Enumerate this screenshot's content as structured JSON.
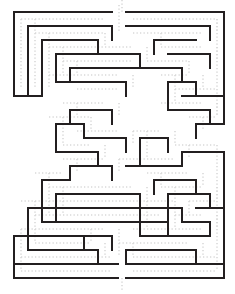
{
  "figure": {
    "kind": "maze-puzzle",
    "width": 235,
    "height": 294,
    "background_color": "#ffffff",
    "wall_color": "#231f20",
    "path_marker_color": "#d9d9d9",
    "wall_thickness": 2.0,
    "path_marker_thickness": 1.6,
    "path_marker_dash": "1.3 2.2"
  },
  "grid": {
    "origin_x": 14,
    "origin_y": 12,
    "cell": 14,
    "cols": 15,
    "rows": 19,
    "right_edge": 224,
    "bottom_edge": 278
  },
  "openings": {
    "entrance_label": "entrance",
    "entrance_side": "top",
    "entrance_col": 7,
    "entrance_x1": 118,
    "entrance_x2": 126,
    "exit_label": "exit",
    "exit_side": "bottom",
    "exit_col": 8,
    "exit_x1": 118,
    "exit_x2": 126
  },
  "walls": {
    "horizontal": [
      [
        14,
        112,
        12
      ],
      [
        126,
        224,
        12
      ],
      [
        28,
        112,
        26
      ],
      [
        126,
        210,
        26
      ],
      [
        154,
        196,
        40
      ],
      [
        42,
        98,
        40
      ],
      [
        56,
        140,
        54
      ],
      [
        168,
        210,
        54
      ],
      [
        70,
        140,
        68
      ],
      [
        140,
        182,
        68
      ],
      [
        56,
        126,
        82
      ],
      [
        168,
        196,
        82
      ],
      [
        182,
        224,
        96
      ],
      [
        14,
        28,
        96
      ],
      [
        28,
        42,
        96
      ],
      [
        70,
        112,
        110
      ],
      [
        168,
        210,
        110
      ],
      [
        56,
        84,
        124
      ],
      [
        196,
        224,
        124
      ],
      [
        84,
        126,
        138
      ],
      [
        140,
        168,
        138
      ],
      [
        56,
        98,
        152
      ],
      [
        182,
        224,
        152
      ],
      [
        70,
        112,
        166
      ],
      [
        126,
        182,
        166
      ],
      [
        42,
        70,
        180
      ],
      [
        154,
        196,
        180
      ],
      [
        56,
        140,
        194
      ],
      [
        168,
        210,
        194
      ],
      [
        28,
        182,
        208
      ],
      [
        196,
        224,
        208
      ],
      [
        42,
        168,
        222
      ],
      [
        182,
        210,
        222
      ],
      [
        14,
        112,
        236
      ],
      [
        140,
        210,
        236
      ],
      [
        28,
        98,
        250
      ],
      [
        126,
        196,
        250
      ],
      [
        14,
        118,
        264
      ],
      [
        126,
        224,
        264
      ],
      [
        14,
        118,
        278
      ],
      [
        126,
        224,
        278
      ]
    ],
    "vertical": [
      [
        14,
        12,
        96
      ],
      [
        14,
        236,
        278
      ],
      [
        224,
        12,
        124
      ],
      [
        224,
        152,
        278
      ],
      [
        28,
        26,
        96
      ],
      [
        28,
        208,
        250
      ],
      [
        42,
        40,
        96
      ],
      [
        42,
        180,
        222
      ],
      [
        56,
        54,
        82
      ],
      [
        56,
        124,
        152
      ],
      [
        56,
        194,
        222
      ],
      [
        70,
        68,
        82
      ],
      [
        70,
        110,
        124
      ],
      [
        70,
        166,
        180
      ],
      [
        84,
        124,
        138
      ],
      [
        84,
        236,
        250
      ],
      [
        98,
        40,
        54
      ],
      [
        98,
        152,
        166
      ],
      [
        98,
        250,
        264
      ],
      [
        112,
        26,
        40
      ],
      [
        112,
        110,
        124
      ],
      [
        112,
        166,
        180
      ],
      [
        112,
        236,
        250
      ],
      [
        126,
        82,
        96
      ],
      [
        126,
        138,
        152
      ],
      [
        126,
        250,
        264
      ],
      [
        140,
        54,
        68
      ],
      [
        140,
        138,
        166
      ],
      [
        140,
        194,
        236
      ],
      [
        154,
        40,
        54
      ],
      [
        154,
        180,
        194
      ],
      [
        168,
        82,
        110
      ],
      [
        168,
        138,
        152
      ],
      [
        168,
        194,
        236
      ],
      [
        182,
        68,
        82
      ],
      [
        182,
        152,
        166
      ],
      [
        182,
        208,
        222
      ],
      [
        196,
        82,
        96
      ],
      [
        196,
        124,
        138
      ],
      [
        196,
        180,
        194
      ],
      [
        196,
        250,
        264
      ],
      [
        210,
        26,
        40
      ],
      [
        210,
        54,
        68
      ],
      [
        210,
        110,
        124
      ],
      [
        210,
        194,
        208
      ],
      [
        210,
        222,
        236
      ]
    ]
  },
  "path_markers": {
    "horizontal": [
      [
        21,
        105,
        19
      ],
      [
        133,
        217,
        19
      ],
      [
        35,
        105,
        33
      ],
      [
        133,
        203,
        33
      ],
      [
        49,
        133,
        47
      ],
      [
        161,
        203,
        47
      ],
      [
        63,
        133,
        61
      ],
      [
        147,
        189,
        61
      ],
      [
        49,
        119,
        75
      ],
      [
        161,
        189,
        75
      ],
      [
        77,
        119,
        89
      ],
      [
        175,
        217,
        89
      ],
      [
        63,
        105,
        103
      ],
      [
        161,
        203,
        103
      ],
      [
        49,
        91,
        117
      ],
      [
        189,
        217,
        117
      ],
      [
        77,
        119,
        131
      ],
      [
        133,
        161,
        131
      ],
      [
        63,
        91,
        145
      ],
      [
        175,
        217,
        145
      ],
      [
        63,
        105,
        159
      ],
      [
        119,
        175,
        159
      ],
      [
        35,
        63,
        173
      ],
      [
        147,
        189,
        173
      ],
      [
        49,
        133,
        187
      ],
      [
        161,
        203,
        187
      ],
      [
        21,
        175,
        201
      ],
      [
        189,
        217,
        201
      ],
      [
        35,
        161,
        215
      ],
      [
        175,
        203,
        215
      ],
      [
        21,
        105,
        229
      ],
      [
        133,
        203,
        229
      ],
      [
        35,
        91,
        243
      ],
      [
        119,
        189,
        243
      ],
      [
        21,
        111,
        257
      ],
      [
        133,
        217,
        257
      ],
      [
        21,
        111,
        271
      ],
      [
        133,
        217,
        271
      ]
    ],
    "vertical": [
      [
        21,
        19,
        89
      ],
      [
        21,
        229,
        271
      ],
      [
        217,
        19,
        117
      ],
      [
        217,
        145,
        271
      ],
      [
        35,
        19,
        89
      ],
      [
        35,
        201,
        243
      ],
      [
        49,
        33,
        89
      ],
      [
        49,
        173,
        215
      ],
      [
        63,
        47,
        75
      ],
      [
        63,
        117,
        145
      ],
      [
        63,
        187,
        215
      ],
      [
        77,
        61,
        75
      ],
      [
        77,
        103,
        117
      ],
      [
        77,
        159,
        173
      ],
      [
        91,
        117,
        131
      ],
      [
        91,
        229,
        243
      ],
      [
        105,
        33,
        47
      ],
      [
        105,
        145,
        159
      ],
      [
        105,
        243,
        257
      ],
      [
        119,
        5,
        33
      ],
      [
        119,
        103,
        117
      ],
      [
        119,
        159,
        173
      ],
      [
        119,
        229,
        257
      ],
      [
        133,
        75,
        89
      ],
      [
        133,
        131,
        145
      ],
      [
        133,
        243,
        257
      ],
      [
        147,
        47,
        61
      ],
      [
        147,
        131,
        159
      ],
      [
        147,
        187,
        229
      ],
      [
        161,
        33,
        47
      ],
      [
        161,
        173,
        187
      ],
      [
        175,
        75,
        103
      ],
      [
        175,
        131,
        145
      ],
      [
        175,
        187,
        229
      ],
      [
        189,
        61,
        75
      ],
      [
        189,
        145,
        159
      ],
      [
        189,
        201,
        215
      ],
      [
        203,
        75,
        89
      ],
      [
        203,
        117,
        131
      ],
      [
        203,
        173,
        187
      ],
      [
        203,
        243,
        257
      ],
      [
        217,
        19,
        33
      ],
      [
        217,
        47,
        61
      ],
      [
        217,
        103,
        117
      ],
      [
        217,
        187,
        201
      ],
      [
        217,
        215,
        229
      ],
      [
        122,
        0,
        12
      ],
      [
        122,
        278,
        292
      ]
    ]
  }
}
